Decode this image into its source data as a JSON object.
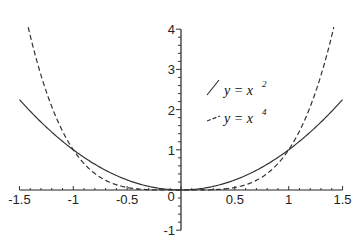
{
  "chart_data": {
    "type": "line",
    "title": "",
    "xlabel": "",
    "ylabel": "",
    "xlim": [
      -1.5,
      1.5
    ],
    "ylim": [
      -1,
      4
    ],
    "grid": false,
    "legend_position": "upper-right-inside",
    "x_ticks": [
      "-1.5",
      "-1",
      "-0.5",
      "0",
      "0.5",
      "1",
      "1.5"
    ],
    "y_ticks": [
      "-1",
      "1",
      "2",
      "3",
      "4"
    ],
    "series": [
      {
        "name": "y = x^2",
        "legend_base": "y = x",
        "legend_exp": "2",
        "style": "solid",
        "exponent": 2,
        "x": [
          -1.5,
          -1.25,
          -1,
          -0.75,
          -0.5,
          -0.25,
          0,
          0.25,
          0.5,
          0.75,
          1,
          1.25,
          1.5
        ],
        "values": [
          2.25,
          1.5625,
          1,
          0.5625,
          0.25,
          0.0625,
          0,
          0.0625,
          0.25,
          0.5625,
          1,
          1.5625,
          2.25
        ]
      },
      {
        "name": "y = x^4",
        "legend_base": "y = x",
        "legend_exp": "4",
        "style": "dashed",
        "exponent": 4,
        "x": [
          -1.414,
          -1.25,
          -1,
          -0.75,
          -0.5,
          -0.25,
          0,
          0.25,
          0.5,
          0.75,
          1,
          1.25,
          1.414
        ],
        "values": [
          4.0,
          2.441,
          1,
          0.316,
          0.0625,
          0.0039,
          0,
          0.0039,
          0.0625,
          0.316,
          1,
          2.441,
          4.0
        ]
      }
    ],
    "annotations": []
  }
}
